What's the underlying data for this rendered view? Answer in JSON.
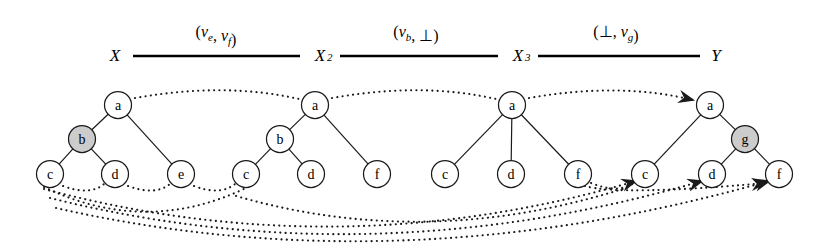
{
  "figure": {
    "kind": "tree-edit-script-diagram",
    "background": "#ffffff",
    "ink_color": "#1a1a1a",
    "shaded_node_color": "#cccccc",
    "sequence": {
      "states": [
        {
          "id": "X",
          "label": "X",
          "subscript": "",
          "x": 115,
          "y": 55
        },
        {
          "id": "X2",
          "label": "X",
          "subscript": "2",
          "x": 320,
          "y": 55
        },
        {
          "id": "X3",
          "label": "X",
          "subscript": "3",
          "x": 518,
          "y": 55
        },
        {
          "id": "Y",
          "label": "Y",
          "subscript": "",
          "x": 716,
          "y": 55
        }
      ],
      "edges": [
        {
          "from": "X",
          "to": "X2",
          "x1": 133,
          "x2": 300,
          "y": 56,
          "annotation": {
            "open": "(",
            "left": "v",
            "left_sub": "e",
            "comma": ", ",
            "right": "v",
            "right_sub": "f",
            "close": ")",
            "text": "(v_e, v_f)",
            "x": 216,
            "y": 37
          }
        },
        {
          "from": "X2",
          "to": "X3",
          "x1": 340,
          "x2": 498,
          "y": 56,
          "annotation": {
            "open": "(",
            "left": "v",
            "left_sub": "b",
            "comma": ", ",
            "right": "⊥",
            "right_sub": "",
            "close": ")",
            "text": "(v_b, ⊥)",
            "x": 416,
            "y": 37
          }
        },
        {
          "from": "X3",
          "to": "Y",
          "x1": 538,
          "x2": 700,
          "y": 56,
          "annotation": {
            "open": "(",
            "left": "⊥",
            "left_sub": "",
            "comma": ", ",
            "right": "v",
            "right_sub": "g",
            "close": ")",
            "text": "(⊥, v_g)",
            "x": 616,
            "y": 37
          }
        }
      ]
    },
    "trees": [
      {
        "name": "tree-X",
        "nodes": [
          {
            "id": "t1-a",
            "label": "a",
            "x": 118,
            "y": 105,
            "shaded": false
          },
          {
            "id": "t1-b",
            "label": "b",
            "x": 82,
            "y": 139,
            "shaded": true
          },
          {
            "id": "t1-c",
            "label": "c",
            "x": 50,
            "y": 174,
            "shaded": false
          },
          {
            "id": "t1-d",
            "label": "d",
            "x": 115,
            "y": 174,
            "shaded": false
          },
          {
            "id": "t1-e",
            "label": "e",
            "x": 181,
            "y": 174,
            "shaded": false
          }
        ],
        "edges": [
          {
            "from": "t1-a",
            "to": "t1-b"
          },
          {
            "from": "t1-a",
            "to": "t1-e"
          },
          {
            "from": "t1-b",
            "to": "t1-c"
          },
          {
            "from": "t1-b",
            "to": "t1-d"
          }
        ]
      },
      {
        "name": "tree-X2",
        "nodes": [
          {
            "id": "t2-a",
            "label": "a",
            "x": 315,
            "y": 105,
            "shaded": false
          },
          {
            "id": "t2-b",
            "label": "b",
            "x": 280,
            "y": 139,
            "shaded": false
          },
          {
            "id": "t2-c",
            "label": "c",
            "x": 246,
            "y": 174,
            "shaded": false
          },
          {
            "id": "t2-d",
            "label": "d",
            "x": 311,
            "y": 174,
            "shaded": false
          },
          {
            "id": "t2-f",
            "label": "f",
            "x": 377,
            "y": 174,
            "shaded": false
          }
        ],
        "edges": [
          {
            "from": "t2-a",
            "to": "t2-b"
          },
          {
            "from": "t2-a",
            "to": "t2-f"
          },
          {
            "from": "t2-b",
            "to": "t2-c"
          },
          {
            "from": "t2-b",
            "to": "t2-d"
          }
        ]
      },
      {
        "name": "tree-X3",
        "nodes": [
          {
            "id": "t3-a",
            "label": "a",
            "x": 512,
            "y": 105,
            "shaded": false
          },
          {
            "id": "t3-c",
            "label": "c",
            "x": 445,
            "y": 174,
            "shaded": false
          },
          {
            "id": "t3-d",
            "label": "d",
            "x": 511,
            "y": 174,
            "shaded": false
          },
          {
            "id": "t3-f",
            "label": "f",
            "x": 578,
            "y": 174,
            "shaded": false
          }
        ],
        "edges": [
          {
            "from": "t3-a",
            "to": "t3-c"
          },
          {
            "from": "t3-a",
            "to": "t3-d"
          },
          {
            "from": "t3-a",
            "to": "t3-f"
          }
        ]
      },
      {
        "name": "tree-Y",
        "nodes": [
          {
            "id": "t4-a",
            "label": "a",
            "x": 710,
            "y": 105,
            "shaded": false
          },
          {
            "id": "t4-g",
            "label": "g",
            "x": 745,
            "y": 139,
            "shaded": true
          },
          {
            "id": "t4-c",
            "label": "c",
            "x": 645,
            "y": 174,
            "shaded": false
          },
          {
            "id": "t4-d",
            "label": "d",
            "x": 712,
            "y": 174,
            "shaded": false
          },
          {
            "id": "t4-f",
            "label": "f",
            "x": 779,
            "y": 174,
            "shaded": false
          }
        ],
        "edges": [
          {
            "from": "t4-a",
            "to": "t4-c"
          },
          {
            "from": "t4-a",
            "to": "t4-g"
          },
          {
            "from": "t4-g",
            "to": "t4-d"
          },
          {
            "from": "t4-g",
            "to": "t4-f"
          }
        ]
      }
    ],
    "mappings": [
      {
        "name": "map-a-X-to-X2",
        "from": "t1-a",
        "to": "t2-a",
        "path": "M 135 98 Q 225 82 299 99",
        "arrow": false
      },
      {
        "name": "map-a-X2-to-X3",
        "from": "t2-a",
        "to": "t3-a",
        "path": "M 332 98 Q 422 82 496 99",
        "arrow": false
      },
      {
        "name": "map-a-X3-to-Y",
        "from": "t3-a",
        "to": "t4-a",
        "path": "M 529 98 Q 620 82 693 100",
        "arrow": true
      },
      {
        "name": "map-c-X-to-d",
        "from": "t1-c",
        "to": "t1-d",
        "path": "M 63 186 Q 90 196 104 184",
        "arrow": false
      },
      {
        "name": "map-d-X-to-e",
        "from": "t1-d",
        "to": "t1-e",
        "path": "M 128 186 Q 155 196 170 184",
        "arrow": false
      },
      {
        "name": "map-e-X-to-c2",
        "from": "t1-e",
        "to": "t2-c",
        "path": "M 194 186 Q 220 196 235 184",
        "arrow": false
      },
      {
        "name": "map-c-X-to-c2",
        "from": "t1-c",
        "to": "t2-c",
        "path": "M 44 187 Q 145 236 246 188",
        "arrow": false
      },
      {
        "name": "map-c-X-to-Y-c",
        "from": "t1-c",
        "to": "t4-c",
        "path": "M 44 189 Q 340 268 636 181",
        "arrow": true
      },
      {
        "name": "map-d-X-to-Y-d",
        "from": "t1-d",
        "to": "t4-d",
        "path": "M 50 198 Q 370 278 702 181",
        "arrow": true
      },
      {
        "name": "map-e-X-to-Y-f",
        "from": "t1-e",
        "to": "t4-f",
        "path": "M 56 208 Q 400 286 769 181",
        "arrow": true
      },
      {
        "name": "map-c2-to-Y",
        "from": "t2-c",
        "to": "t4-c",
        "path": "M 236 196 Q 430 252 632 186",
        "arrow": false
      },
      {
        "name": "map-f2-to-Y-f",
        "from": "t2-f",
        "to": "t4-f",
        "path": "M 585 186 Q 620 196 766 183",
        "arrow": true
      },
      {
        "name": "map-f3-to-Y-d",
        "from": "t3-f",
        "to": "t4-d",
        "path": "M 591 183 Q 618 194 634 183",
        "arrow": false
      }
    ]
  }
}
